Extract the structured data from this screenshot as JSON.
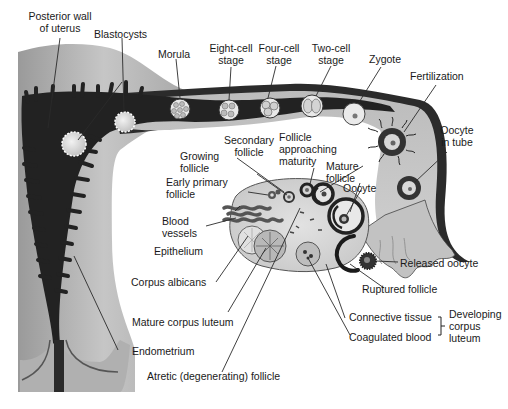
{
  "diagram": {
    "colors": {
      "uterine_wall": "#b5b5b5",
      "uterine_lumen": "#262626",
      "tube_wall": "#3a3a3a",
      "tube_fill": "#c4c4c4",
      "ovary_fill": "#d8d8d8",
      "follicle_dark": "#222222",
      "text": "#1a1a1a",
      "leader_line": "#2a2a2a",
      "background": "#ffffff"
    },
    "labels": {
      "posterior_wall": [
        "Posterior wall",
        "of uterus"
      ],
      "blastocysts": "Blastocysts",
      "morula": "Morula",
      "eight_cell": [
        "Eight-cell",
        "stage"
      ],
      "four_cell": [
        "Four-cell",
        "stage"
      ],
      "two_cell": [
        "Two-cell",
        "stage"
      ],
      "zygote": "Zygote",
      "fertilization": "Fertilization",
      "oocyte_in_tube": [
        "Oocyte",
        "in tube"
      ],
      "secondary_follicle": [
        "Secondary",
        "follicle"
      ],
      "follicle_approaching": [
        "Follicle",
        "approaching",
        "maturity"
      ],
      "growing_follicle": [
        "Growing",
        "follicle"
      ],
      "mature_follicle": [
        "Mature",
        "follicle"
      ],
      "oocyte": "Oocyte",
      "early_primary": [
        "Early primary",
        "follicle"
      ],
      "blood_vessels": [
        "Blood",
        "vessels"
      ],
      "epithelium": "Epithelium",
      "corpus_albicans": "Corpus albicans",
      "released_oocyte": "Released oocyte",
      "ruptured_follicle": "Ruptured follicle",
      "mature_corpus_luteum": "Mature corpus luteum",
      "connective_tissue": "Connective tissue",
      "coagulated_blood": "Coagulated blood",
      "developing_corpus_luteum": [
        "Developing",
        "corpus",
        "luteum"
      ],
      "endometrium": "Endometrium",
      "atretic_follicle": "Atretic (degenerating) follicle"
    }
  }
}
